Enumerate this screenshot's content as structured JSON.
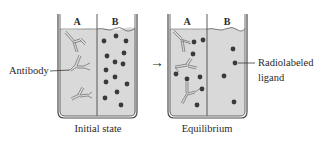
{
  "figure": {
    "labels": {
      "antibody": "Antibody",
      "radiolabeled_ligand_line1": "Radiolabeled",
      "radiolabeled_ligand_line2": "ligand"
    },
    "arrow": "→",
    "panels": [
      {
        "caption": "Initial state",
        "compartments": {
          "left": "A",
          "right": "B"
        }
      },
      {
        "caption": "Equilibrium",
        "compartments": {
          "left": "A",
          "right": "B"
        }
      }
    ],
    "colors": {
      "liquid": "#d9d9d9",
      "outline": "#4a4a4a",
      "ligand_dot": "#3a3a3a",
      "antibody_stroke": "#6a6a6a"
    }
  }
}
